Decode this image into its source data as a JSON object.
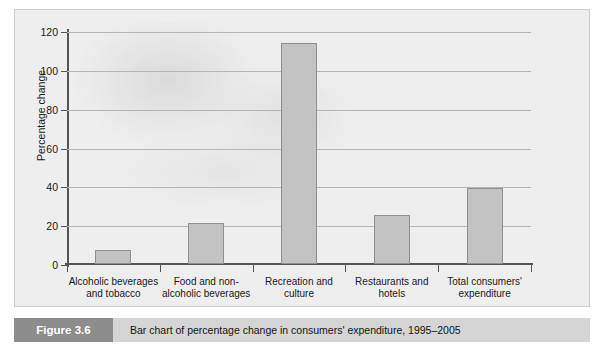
{
  "figure": {
    "number_label": "Figure 3.6",
    "caption": "Bar chart of percentage change in consumers' expenditure, 1995–2005"
  },
  "colors": {
    "panel_background": "#eeeeee",
    "bar_fill": "#c3c3c3",
    "bar_stroke": "#8f8f8f",
    "gridline": "#b4b4b4",
    "axis": "#555555",
    "caption_bar": "#d5d5d5",
    "caption_number_box": "#8d8d8d",
    "caption_number_text": "#ffffff"
  },
  "chart_data": {
    "type": "bar",
    "title": "",
    "xlabel": "",
    "ylabel": "Percentage change",
    "categories": [
      "Alcoholic beverages and tobacco",
      "Food and non-alcoholic beverages",
      "Recreation and culture",
      "Restaurants and hotels",
      "Total consumers' expenditure"
    ],
    "category_lines": [
      [
        "Alcoholic beverages",
        "and tobacco"
      ],
      [
        "Food and non-",
        "alcoholic beverages"
      ],
      [
        "Recreation and",
        "culture"
      ],
      [
        "Restaurants and",
        "hotels"
      ],
      [
        "Total consumers'",
        "expenditure"
      ]
    ],
    "values": [
      7,
      21,
      114,
      25,
      39
    ],
    "ylim": [
      0,
      120
    ],
    "yticks": [
      0,
      20,
      40,
      60,
      80,
      100,
      120
    ],
    "ytick_labels": [
      "0",
      "20",
      "40",
      "60",
      "80",
      "100",
      "120"
    ],
    "grid": true,
    "legend": "none"
  }
}
